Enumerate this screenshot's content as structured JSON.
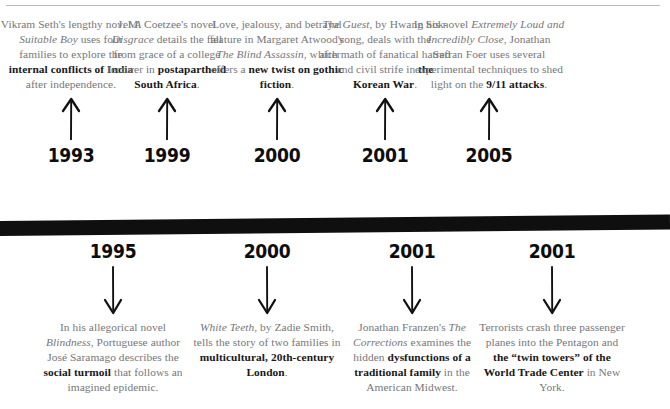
{
  "graphic": {
    "type": "timeline",
    "orientation": "horizontal",
    "bar_color": "#100f0f",
    "body_text_color": "#76767a",
    "emphasis_text_color": "#19181a",
    "rule_color": "#b9b9bb"
  },
  "entries_above": [
    {
      "year": "1993",
      "arrow": "arrow-up-icon",
      "text_runs": [
        {
          "t": "Vikram Seth's lengthy novel ",
          "style": "normal"
        },
        {
          "t": "A Suitable Boy",
          "style": "italic"
        },
        {
          "t": " uses four families to explore the ",
          "style": "normal"
        },
        {
          "t": "internal conflicts of India",
          "style": "bold"
        },
        {
          "t": " after independence.",
          "style": "normal"
        }
      ]
    },
    {
      "year": "1999",
      "arrow": "arrow-up-icon",
      "text_runs": [
        {
          "t": "J. M. Coetzee's novel ",
          "style": "normal"
        },
        {
          "t": "Disgrace",
          "style": "italic"
        },
        {
          "t": " details the fall from grace of a college lecturer in ",
          "style": "normal"
        },
        {
          "t": "postapartheid South Africa",
          "style": "bold"
        },
        {
          "t": ".",
          "style": "normal"
        }
      ]
    },
    {
      "year": "2000",
      "arrow": "arrow-up-icon",
      "text_runs": [
        {
          "t": "Love, jealousy, and betrayal feature in Margaret Atwood's ",
          "style": "normal"
        },
        {
          "t": "The Blind Assassin",
          "style": "italic"
        },
        {
          "t": ", which offers a ",
          "style": "normal"
        },
        {
          "t": "new twist on gothic fiction",
          "style": "bold"
        },
        {
          "t": ".",
          "style": "normal"
        }
      ]
    },
    {
      "year": "2001",
      "arrow": "arrow-up-icon",
      "text_runs": [
        {
          "t": "The Guest",
          "style": "italic"
        },
        {
          "t": ", by Hwang Sok-yong, deals with the aftermath of fanatical hatred and civil strife in ",
          "style": "normal"
        },
        {
          "t": "the Korean War",
          "style": "bold"
        },
        {
          "t": ".",
          "style": "normal"
        }
      ]
    },
    {
      "year": "2005",
      "arrow": "arrow-up-icon",
      "text_runs": [
        {
          "t": "In his novel ",
          "style": "normal"
        },
        {
          "t": "Extremely Loud and Incredibly Close",
          "style": "italic"
        },
        {
          "t": ", Jonathan Safran Foer uses several experimental techniques to shed light on the ",
          "style": "normal"
        },
        {
          "t": "9/11 attacks",
          "style": "bold"
        },
        {
          "t": ".",
          "style": "normal"
        }
      ]
    }
  ],
  "entries_below": [
    {
      "year": "1995",
      "arrow": "arrow-down-icon",
      "text_runs": [
        {
          "t": "In his allegorical novel ",
          "style": "normal"
        },
        {
          "t": "Blindness",
          "style": "italic"
        },
        {
          "t": ", Portuguese author José Saramago describes the ",
          "style": "normal"
        },
        {
          "t": "social turmoil",
          "style": "bold"
        },
        {
          "t": " that follows an imagined epidemic.",
          "style": "normal"
        }
      ]
    },
    {
      "year": "2000",
      "arrow": "arrow-down-icon",
      "text_runs": [
        {
          "t": "White Teeth",
          "style": "italic"
        },
        {
          "t": ", by Zadie Smith, tells the story of two families in ",
          "style": "normal"
        },
        {
          "t": "multicultural, 20th-century London",
          "style": "bold"
        },
        {
          "t": ".",
          "style": "normal"
        }
      ]
    },
    {
      "year": "2001",
      "arrow": "arrow-down-icon",
      "text_runs": [
        {
          "t": "Jonathan Franzen's ",
          "style": "normal"
        },
        {
          "t": "The Corrections",
          "style": "italic"
        },
        {
          "t": " examines the hidden ",
          "style": "normal"
        },
        {
          "t": "dysfunctions of a traditional family",
          "style": "bold"
        },
        {
          "t": " in the American Midwest.",
          "style": "normal"
        }
      ]
    },
    {
      "year": "2001",
      "arrow": "arrow-down-icon",
      "text_runs": [
        {
          "t": "Terrorists crash three passenger planes into the Pentagon and ",
          "style": "normal"
        },
        {
          "t": "the “twin towers” of the World Trade Center",
          "style": "bold"
        },
        {
          "t": " in New York.",
          "style": "normal"
        }
      ]
    }
  ]
}
